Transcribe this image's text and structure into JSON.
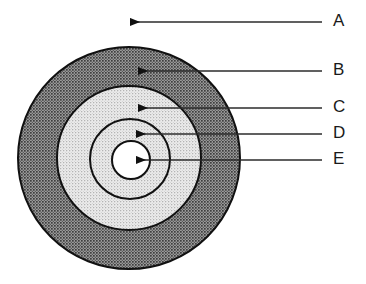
{
  "figure": {
    "background_color": "#ffffff",
    "width": 366,
    "height": 284
  },
  "diagram": {
    "type": "concentric-circles",
    "center": {
      "x": 129,
      "y": 158
    },
    "rings": [
      {
        "id": "outer",
        "label_ref": "B",
        "radius": 111,
        "fill_color": "#8a8a8a",
        "fill_style": "dark-halftone",
        "stroke_color": "#111111",
        "stroke_width": 2
      },
      {
        "id": "middle",
        "label_ref": "C",
        "radius": 72,
        "fill_color": "#d8d8d8",
        "fill_style": "light-halftone",
        "stroke_color": "#111111",
        "stroke_width": 2
      },
      {
        "id": "inner",
        "label_ref": "D",
        "radius": 40,
        "fill_color": "#dcdcdc",
        "fill_style": "light-halftone",
        "stroke_color": "#111111",
        "stroke_width": 2
      },
      {
        "id": "core",
        "label_ref": "E",
        "radius": 19,
        "fill_color": "#ffffff",
        "fill_style": "solid-white",
        "stroke_color": "#111111",
        "stroke_width": 2
      }
    ]
  },
  "callouts": [
    {
      "label": "A",
      "label_x": 333,
      "label_y": 22,
      "line_start_x": 322,
      "line_end_x": 130,
      "line_y": 22,
      "arrow_tip_x": 122,
      "target": "background-area-outside-circles"
    },
    {
      "label": "B",
      "label_x": 333,
      "label_y": 71,
      "line_start_x": 322,
      "line_end_x": 138,
      "line_y": 71,
      "arrow_tip_x": 130,
      "target": "outer-ring"
    },
    {
      "label": "C",
      "label_x": 333,
      "label_y": 108,
      "line_start_x": 322,
      "line_end_x": 138,
      "line_y": 108,
      "arrow_tip_x": 130,
      "target": "middle-ring"
    },
    {
      "label": "D",
      "label_x": 333,
      "label_y": 134,
      "line_start_x": 322,
      "line_end_x": 136,
      "line_y": 134,
      "arrow_tip_x": 128,
      "target": "inner-ring"
    },
    {
      "label": "E",
      "label_x": 333,
      "label_y": 160,
      "line_start_x": 322,
      "line_end_x": 136,
      "line_y": 160,
      "arrow_tip_x": 128,
      "target": "core-circle"
    }
  ],
  "colors": {
    "line": "#2b2b2b",
    "arrow_fill": "#111111",
    "text": "#1a1a1a",
    "outer_ring": "#8a8a8a",
    "middle_ring": "#d8d8d8",
    "core": "#ffffff"
  }
}
